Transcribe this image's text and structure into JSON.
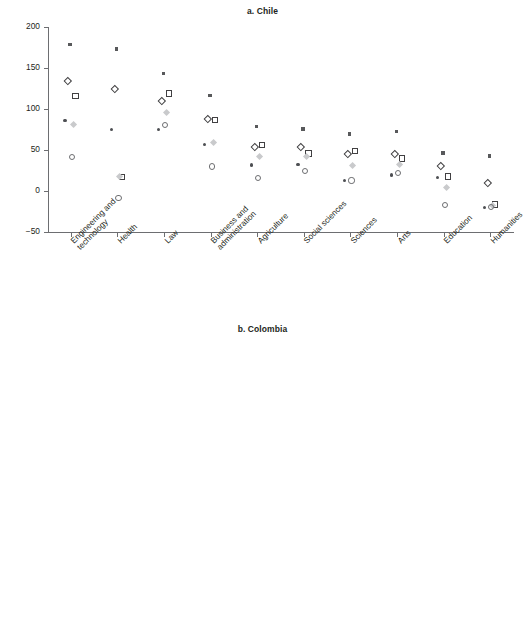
{
  "figure": {
    "width": 525,
    "height": 621,
    "background": "#ffffff",
    "text_color": "#231f20"
  },
  "series_styles": [
    {
      "key": "s1",
      "marker": "small-filled-square",
      "color": "#58595b"
    },
    {
      "key": "s2",
      "marker": "open-diamond",
      "color": "#414042"
    },
    {
      "key": "s3",
      "marker": "open-square",
      "color": "#414042"
    },
    {
      "key": "s4",
      "marker": "small-filled-dot",
      "color": "#4d4f53"
    },
    {
      "key": "s5",
      "marker": "filled-diamond-light",
      "color": "#c9cacc"
    },
    {
      "key": "s6",
      "marker": "open-circle",
      "color": "#6d6e71"
    }
  ],
  "chart_data": [
    {
      "id": "chart-a",
      "type": "scatter",
      "title": "a. Chile",
      "xlabel": "",
      "ylabel": "",
      "ylim": [
        -50,
        200
      ],
      "yticks": [
        -50,
        0,
        50,
        100,
        150,
        200
      ],
      "ytick_labels": [
        "−50",
        "0",
        "50",
        "100",
        "150",
        "200"
      ],
      "grid": false,
      "legend": "none",
      "categories": [
        "Engineering and\ntechnology",
        "Health",
        "Law",
        "Business and\nadministration",
        "Agriculture",
        "Social sciences",
        "Sciences",
        "Arts",
        "Education",
        "Humanities"
      ],
      "series": [
        {
          "name": "s1",
          "marker": "small-filled-square",
          "color": "#58595b",
          "values": [
            177,
            172,
            142,
            115,
            77,
            74,
            68,
            71,
            45,
            41
          ]
        },
        {
          "name": "s2",
          "marker": "open-diamond",
          "color": "#414042",
          "values": [
            134,
            125,
            110,
            88,
            54,
            54,
            45,
            45,
            31,
            10
          ]
        },
        {
          "name": "s3",
          "marker": "open-square",
          "color": "#414042",
          "values": [
            116,
            17,
            119,
            87,
            56,
            46,
            49,
            40,
            18,
            -16
          ]
        },
        {
          "name": "s4",
          "marker": "small-filled-dot",
          "color": "#4d4f53",
          "values": [
            84,
            73,
            73,
            55,
            30,
            31,
            11,
            18,
            15,
            -22
          ]
        },
        {
          "name": "s5",
          "marker": "filled-diamond-light",
          "color": "#c9cacc",
          "values": [
            81,
            17,
            95,
            59,
            42,
            41,
            31,
            32,
            4,
            -18
          ]
        },
        {
          "name": "s6",
          "marker": "open-circle",
          "color": "#6d6e71",
          "values": [
            42,
            -8,
            81,
            30,
            16,
            25,
            13,
            22,
            -17,
            -19
          ]
        }
      ]
    },
    {
      "id": "chart-b",
      "type": "scatter",
      "title": "b. Colombia",
      "xlabel": "",
      "ylabel": "",
      "ylim": [
        -50,
        200
      ],
      "yticks": [
        -50,
        0,
        50,
        100,
        150,
        200
      ],
      "ytick_labels": [
        "−50",
        "0",
        "50",
        "100",
        "150",
        "200"
      ],
      "grid": false,
      "legend": "none",
      "categories": [
        "Law",
        "Engineering and\ntechnology",
        "Sciences",
        "Business and\nadministration",
        "Health",
        "Agriculture",
        "Social sciences",
        "Humanities",
        "Arts",
        "Education"
      ],
      "series": [
        {
          "name": "s1",
          "marker": "small-filled-square",
          "color": "#58595b",
          "values": [
            112,
            103,
            84,
            87,
            58,
            52,
            54,
            52,
            45,
            17
          ]
        },
        {
          "name": "s2",
          "marker": "open-diamond",
          "color": "#414042",
          "values": [
            88,
            75,
            55,
            50,
            37,
            37,
            34,
            28,
            22,
            7
          ]
        },
        {
          "name": "s3",
          "marker": "open-square",
          "color": "#414042",
          "values": [
            10,
            30,
            22,
            30,
            16,
            13,
            12,
            21,
            17,
            19
          ]
        },
        {
          "name": "s4",
          "marker": "small-filled-dot",
          "color": "#4d4f53",
          "values": [
            61,
            41,
            11,
            5,
            6,
            15,
            9,
            -3,
            -5,
            -8
          ]
        },
        {
          "name": "s5",
          "marker": "filled-diamond-light",
          "color": "#c9cacc",
          "values": [
            -9,
            12,
            1,
            1,
            2,
            -5,
            -2,
            5,
            0,
            -7
          ]
        },
        {
          "name": "s6",
          "marker": "open-circle",
          "color": "#6d6e71",
          "values": [
            -29,
            -16,
            -15,
            -30,
            -20,
            -27,
            -29,
            -12,
            -23,
            -20
          ]
        }
      ]
    }
  ]
}
